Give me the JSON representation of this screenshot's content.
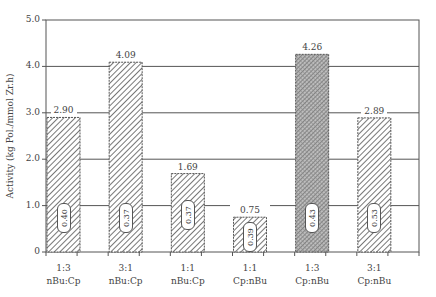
{
  "chart_data": {
    "type": "bar",
    "title": "",
    "xlabel": "",
    "ylabel": "Activity (kg Pol./mmol Zr.h)",
    "ylim": [
      0,
      5.0
    ],
    "yticks": [
      "0",
      "1.0",
      "2.0",
      "3.0",
      "4.0",
      "5.0"
    ],
    "grid": true,
    "legend": null,
    "categories": [
      "1:3 nBu:Cp",
      "3:1 nBu:Cp",
      "1:1 nBu:Cp",
      "1:1 Cp:nBu",
      "1:3 Cp:nBu",
      "3:1 Cp:nBu"
    ],
    "category_lines": [
      [
        "1:3",
        "nBu:Cp"
      ],
      [
        "3:1",
        "nBu:Cp"
      ],
      [
        "1:1",
        "nBu:Cp"
      ],
      [
        "1:1",
        "Cp:nBu"
      ],
      [
        "1:3",
        "Cp:nBu"
      ],
      [
        "3:1",
        "Cp:nBu"
      ]
    ],
    "values": [
      2.9,
      4.09,
      1.69,
      0.75,
      4.26,
      2.89
    ],
    "value_labels": [
      "2.90",
      "4.09",
      "1.69",
      "0.75",
      "4.26",
      "2.89"
    ],
    "inner_labels": [
      "0.40",
      "0.37",
      "0.37",
      "0.39",
      "0.43",
      "0.53"
    ],
    "patterns": [
      "diagonal",
      "diagonal",
      "diagonal",
      "diagonal",
      "dense-crosshatch",
      "diagonal"
    ]
  },
  "colors": {
    "axis": "#555555",
    "grid": "#555555",
    "hatch": "#555555",
    "dense": "#8a8a8a"
  }
}
